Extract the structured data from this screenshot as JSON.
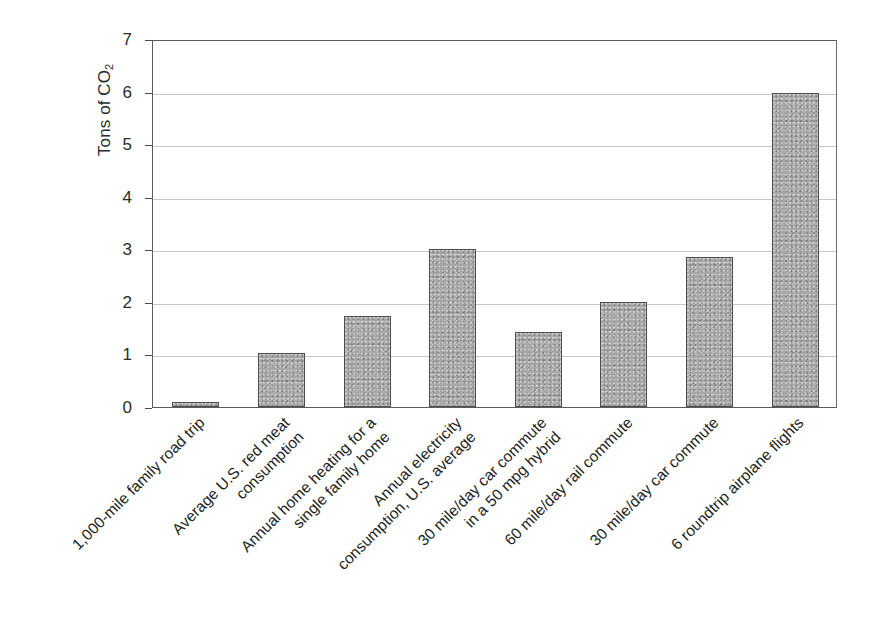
{
  "chart_data": {
    "type": "bar",
    "title": "",
    "xlabel": "",
    "ylabel": "Tons of CO2",
    "ylabel_display": "Tons of CO",
    "ylabel_subscript": "2",
    "ylim": [
      0,
      7
    ],
    "ytick_labels": [
      "0",
      "1",
      "2",
      "3",
      "4",
      "5",
      "6",
      "7"
    ],
    "ytick_values": [
      0,
      1,
      2,
      3,
      4,
      5,
      6,
      7
    ],
    "grid": true,
    "legend": "none",
    "bar_color": "#a9a7a6",
    "bar_edge_color": "#4f4d4c",
    "categories": [
      "1,000-mile family road trip",
      "Average U.S. red meat\nconsumption",
      "Annual home heating for a\nsingle family home",
      "Annual electricity\nconsumption, U.S. average",
      "30 mile/day car commute\nin a 50 mpg hybrid",
      "60 mile/day rail commute",
      "30 mile/day car commute",
      "6 roundtrip airplane flights"
    ],
    "values": [
      0.1,
      1.02,
      1.74,
      3.0,
      1.43,
      2.0,
      2.85,
      5.97
    ],
    "bars": [
      {
        "label_line1": "1,000-mile family road trip",
        "label_line2": "",
        "value": 0.1
      },
      {
        "label_line1": "Average U.S. red meat",
        "label_line2": "consumption",
        "value": 1.02
      },
      {
        "label_line1": "Annual home heating for a",
        "label_line2": "single family home",
        "value": 1.74
      },
      {
        "label_line1": "Annual electricity",
        "label_line2": "consumption, U.S. average",
        "value": 3.0
      },
      {
        "label_line1": "30 mile/day car commute",
        "label_line2": "in a 50 mpg hybrid",
        "value": 1.43
      },
      {
        "label_line1": "60 mile/day rail commute",
        "label_line2": "",
        "value": 2.0
      },
      {
        "label_line1": "30 mile/day car commute",
        "label_line2": "",
        "value": 2.85
      },
      {
        "label_line1": "6 roundtrip airplane flights",
        "label_line2": "",
        "value": 5.97
      }
    ]
  }
}
